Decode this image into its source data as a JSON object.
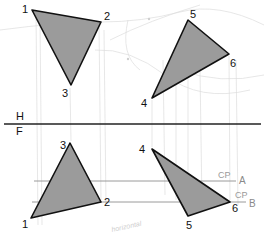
{
  "diagram": {
    "type": "descriptive-geometry-orthographic-projection",
    "colors": {
      "background": "#ffffff",
      "face_fill": "#9b9b9b",
      "edge": "#111111",
      "construction": "#d8d8d8",
      "cutting_plane": "#8f8f8f",
      "label": "#111111"
    },
    "fold_line": {
      "upper_label": "H",
      "lower_label": "F",
      "y": 124
    },
    "top_view": {
      "triangles": [
        {
          "name": "triangle-123-top",
          "vertices": [
            {
              "label": "1",
              "x": 32,
              "y": 10
            },
            {
              "label": "2",
              "x": 101,
              "y": 22
            },
            {
              "label": "3",
              "x": 71,
              "y": 85
            }
          ]
        },
        {
          "name": "triangle-456-top",
          "vertices": [
            {
              "label": "4",
              "x": 152,
              "y": 98
            },
            {
              "label": "5",
              "x": 188,
              "y": 20
            },
            {
              "label": "6",
              "x": 229,
              "y": 54
            }
          ]
        }
      ]
    },
    "front_view": {
      "triangles": [
        {
          "name": "triangle-123-front",
          "vertices": [
            {
              "label": "1",
              "x": 31,
              "y": 218
            },
            {
              "label": "2",
              "x": 101,
              "y": 202
            },
            {
              "label": "3",
              "x": 70,
              "y": 143
            }
          ]
        },
        {
          "name": "triangle-456-front",
          "vertices": [
            {
              "label": "4",
              "x": 152,
              "y": 149
            },
            {
              "label": "5",
              "x": 188,
              "y": 216
            },
            {
              "label": "6",
              "x": 230,
              "y": 202
            }
          ]
        }
      ],
      "cutting_planes": [
        {
          "name": "A",
          "label": "A",
          "cp_label": "CP",
          "y": 181
        },
        {
          "name": "B",
          "label": "B",
          "cp_label": "CP",
          "y": 202
        }
      ],
      "annotation": "horizontal"
    }
  },
  "labels": {
    "v1_top": "1",
    "v2_top": "2",
    "v3_top": "3",
    "v4_top": "4",
    "v5_top": "5",
    "v6_top": "6",
    "v1_front": "1",
    "v2_front": "2",
    "v3_front": "3",
    "v4_front": "4",
    "v5_front": "5",
    "v6_front": "6",
    "plane_h": "H",
    "plane_f": "F",
    "cp_a": "CP",
    "cp_b": "CP",
    "line_a": "A",
    "line_b": "B",
    "note": "horizontal"
  }
}
